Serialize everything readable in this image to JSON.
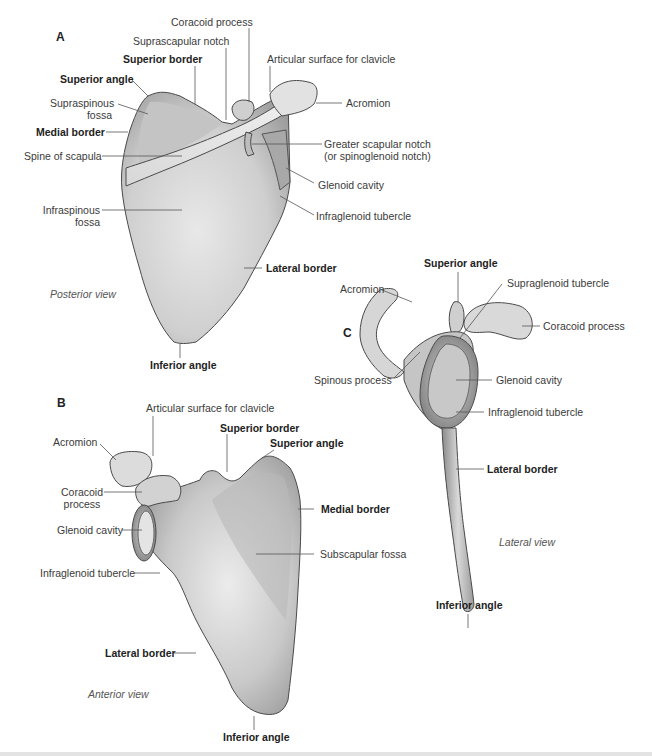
{
  "figure": {
    "panels": {
      "A": {
        "letter": "A",
        "view": "Posterior view",
        "labels": {
          "coracoid_process": "Coracoid process",
          "suprascapular_notch": "Suprascapular notch",
          "superior_border": "Superior border",
          "articular_surface": "Articular surface for clavicle",
          "superior_angle": "Superior angle",
          "supraspinous_fossa_1": "Supraspinous",
          "supraspinous_fossa_2": "fossa",
          "acromion": "Acromion",
          "medial_border": "Medial border",
          "greater_notch_1": "Greater scapular notch",
          "greater_notch_2": "(or spinoglenoid notch)",
          "spine": "Spine of scapula",
          "glenoid_cavity": "Glenoid cavity",
          "infraglenoid": "Infraglenoid tubercle",
          "infraspinous_fossa_1": "Infraspinous",
          "infraspinous_fossa_2": "fossa",
          "lateral_border": "Lateral border",
          "inferior_angle": "Inferior angle"
        }
      },
      "B": {
        "letter": "B",
        "view": "Anterior view",
        "labels": {
          "articular_surface": "Articular surface for clavicle",
          "superior_border": "Superior border",
          "acromion": "Acromion",
          "superior_angle": "Superior angle",
          "coracoid_1": "Coracoid",
          "coracoid_2": "process",
          "medial_border": "Medial border",
          "glenoid_cavity": "Glenoid cavity",
          "subscapular_fossa": "Subscapular fossa",
          "infraglenoid": "Infraglenoid tubercle",
          "lateral_border": "Lateral border",
          "inferior_angle": "Inferior angle"
        }
      },
      "C": {
        "letter": "C",
        "view": "Lateral view",
        "labels": {
          "superior_angle": "Superior angle",
          "acromion": "Acromion",
          "supraglenoid": "Supraglenoid tubercle",
          "coracoid_process": "Coracoid process",
          "spinous_process": "Spinous process",
          "glenoid_cavity": "Glenoid cavity",
          "infraglenoid": "Infraglenoid tubercle",
          "lateral_border": "Lateral border",
          "inferior_angle": "Inferior angle"
        }
      }
    },
    "colors": {
      "bone_light": "#e6e6e6",
      "bone_mid": "#bdbdbd",
      "bone_dark": "#8a8a8a",
      "outline": "#4a4a4a",
      "leader": "#555555",
      "footer": "#e3e3e3"
    }
  }
}
